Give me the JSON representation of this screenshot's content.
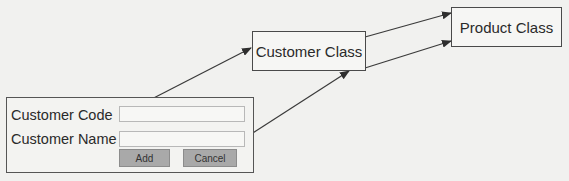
{
  "diagram": {
    "nodes": {
      "customer_class": {
        "label": "Customer Class"
      },
      "product_class": {
        "label": "Product Class"
      }
    },
    "form": {
      "fields": [
        {
          "label": "Customer Code",
          "value": ""
        },
        {
          "label": "Customer Name",
          "value": ""
        }
      ],
      "buttons": {
        "add": "Add",
        "cancel": "Cancel"
      }
    },
    "edges": [
      {
        "from": "Customer Code input",
        "to": "Customer Class"
      },
      {
        "from": "Customer Name input",
        "to": "Customer Class"
      },
      {
        "from": "Customer Class",
        "to": "Product Class"
      },
      {
        "from": "Customer Class",
        "to": "Product Class"
      }
    ],
    "colors": {
      "line": "#3a3a3a",
      "button": "#a9a9a9",
      "background": "#f1f1ef"
    }
  }
}
